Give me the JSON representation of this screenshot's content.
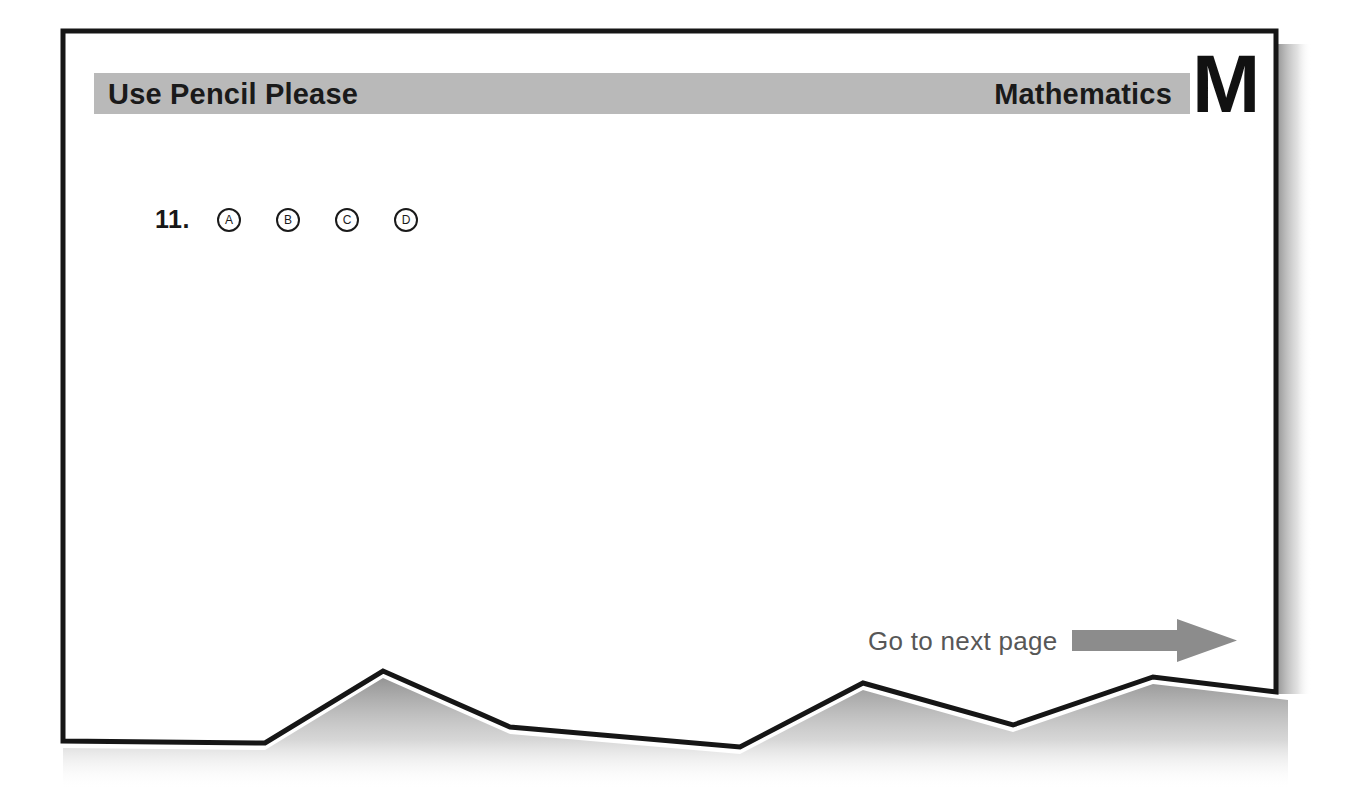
{
  "page": {
    "kind": "answer-sheet-page",
    "background_color": "#ffffff",
    "sheet_color": "#ffffff",
    "border_color": "#161616",
    "shadow_color": "#9a9a9a"
  },
  "header": {
    "instruction": "Use Pencil Please",
    "subject": "Mathematics",
    "subject_letter": "M",
    "band_color": "#b9b9b9",
    "text_color": "#1a1a1a"
  },
  "questions": [
    {
      "number": "11.",
      "options": [
        {
          "label": "A",
          "name": "bubble-a",
          "filled": false
        },
        {
          "label": "B",
          "name": "bubble-b",
          "filled": false
        },
        {
          "label": "C",
          "name": "bubble-c",
          "filled": false
        },
        {
          "label": "D",
          "name": "bubble-d",
          "filled": false
        }
      ]
    }
  ],
  "footer": {
    "next_page_label": "Go to next page",
    "arrow_icon": "right-arrow-icon",
    "arrow_color": "#8c8c8c",
    "text_color": "#575757"
  }
}
